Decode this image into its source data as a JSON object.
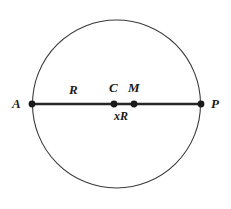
{
  "figure": {
    "type": "geometry-diagram",
    "canvas": {
      "width": 231,
      "height": 209
    },
    "background_color": "#ffffff",
    "stroke_color": "#262626",
    "circle": {
      "center_x": 116.5,
      "center_y": 104,
      "radius": 84,
      "stroke_color": "#3a3a3a",
      "stroke_width": 1.1,
      "fill": "none"
    },
    "chord": {
      "x1": 32,
      "y1": 104,
      "x2": 201,
      "y2": 104,
      "stroke_color": "#262626",
      "stroke_width": 2.4
    },
    "points": [
      {
        "id": "A",
        "label": "A",
        "x": 32,
        "y": 104,
        "radius": 3.4,
        "label_x": 17,
        "label_y": 104,
        "label_anchor": "end"
      },
      {
        "id": "C",
        "label": "C",
        "x": 114,
        "y": 104,
        "radius": 3.4,
        "label_x": 114,
        "label_y": 88,
        "label_anchor": "middle"
      },
      {
        "id": "M",
        "label": "M",
        "x": 134,
        "y": 104,
        "radius": 3.4,
        "label_x": 134,
        "label_y": 88,
        "label_anchor": "middle"
      },
      {
        "id": "P",
        "label": "P",
        "x": 201,
        "y": 104,
        "radius": 3.4,
        "label_x": 214,
        "label_y": 104,
        "label_anchor": "start"
      }
    ],
    "segment_labels": [
      {
        "id": "R",
        "text": "R",
        "x": 73,
        "y": 90,
        "anchor": "middle"
      },
      {
        "id": "xR",
        "text": "xR",
        "x": 122,
        "y": 118,
        "anchor": "middle"
      }
    ]
  }
}
